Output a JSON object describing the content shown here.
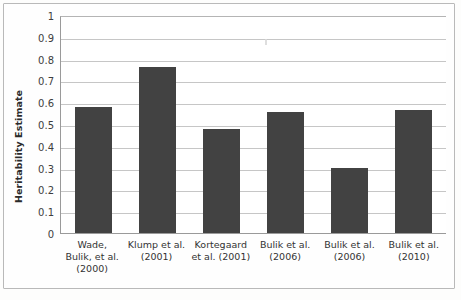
{
  "chart_data": {
    "type": "bar",
    "title": "",
    "xlabel": "",
    "ylabel": "Heritability Estimate",
    "ylim": [
      0,
      1
    ],
    "ytick_step": 0.1,
    "grid": true,
    "legend": "none",
    "bar_color": "#424242",
    "gridline_color": "#c6c6c6",
    "axis_color": "#9a9a9a",
    "categories": [
      "Wade, Bulik, et al. (2000)",
      "Klump et al. (2001)",
      "Kortegaard et al. (2001)",
      "Bulik et al. (2006)",
      "Bulik et al. (2006)",
      "Bulik et al. (2010)"
    ],
    "category_lines": [
      [
        "Wade,",
        "Bulik, et al.",
        "(2000)"
      ],
      [
        "Klump et al.",
        "(2001)"
      ],
      [
        "Kortegaard",
        "et al. (2001)"
      ],
      [
        "Bulik et al.",
        "(2006)"
      ],
      [
        "Bulik et al.",
        "(2006)"
      ],
      [
        "Bulik et al.",
        "(2010)"
      ]
    ],
    "values": [
      0.58,
      0.76,
      0.475,
      0.555,
      0.3,
      0.565
    ],
    "ytick_labels": [
      "1",
      "0.9",
      "0.8",
      "0.7",
      "0.6",
      "0.5",
      "0.4",
      "0.3",
      "0.2",
      "0.1",
      "0"
    ],
    "ytick_values": [
      1,
      0.9,
      0.8,
      0.7,
      0.6,
      0.5,
      0.4,
      0.3,
      0.2,
      0.1,
      0
    ]
  }
}
